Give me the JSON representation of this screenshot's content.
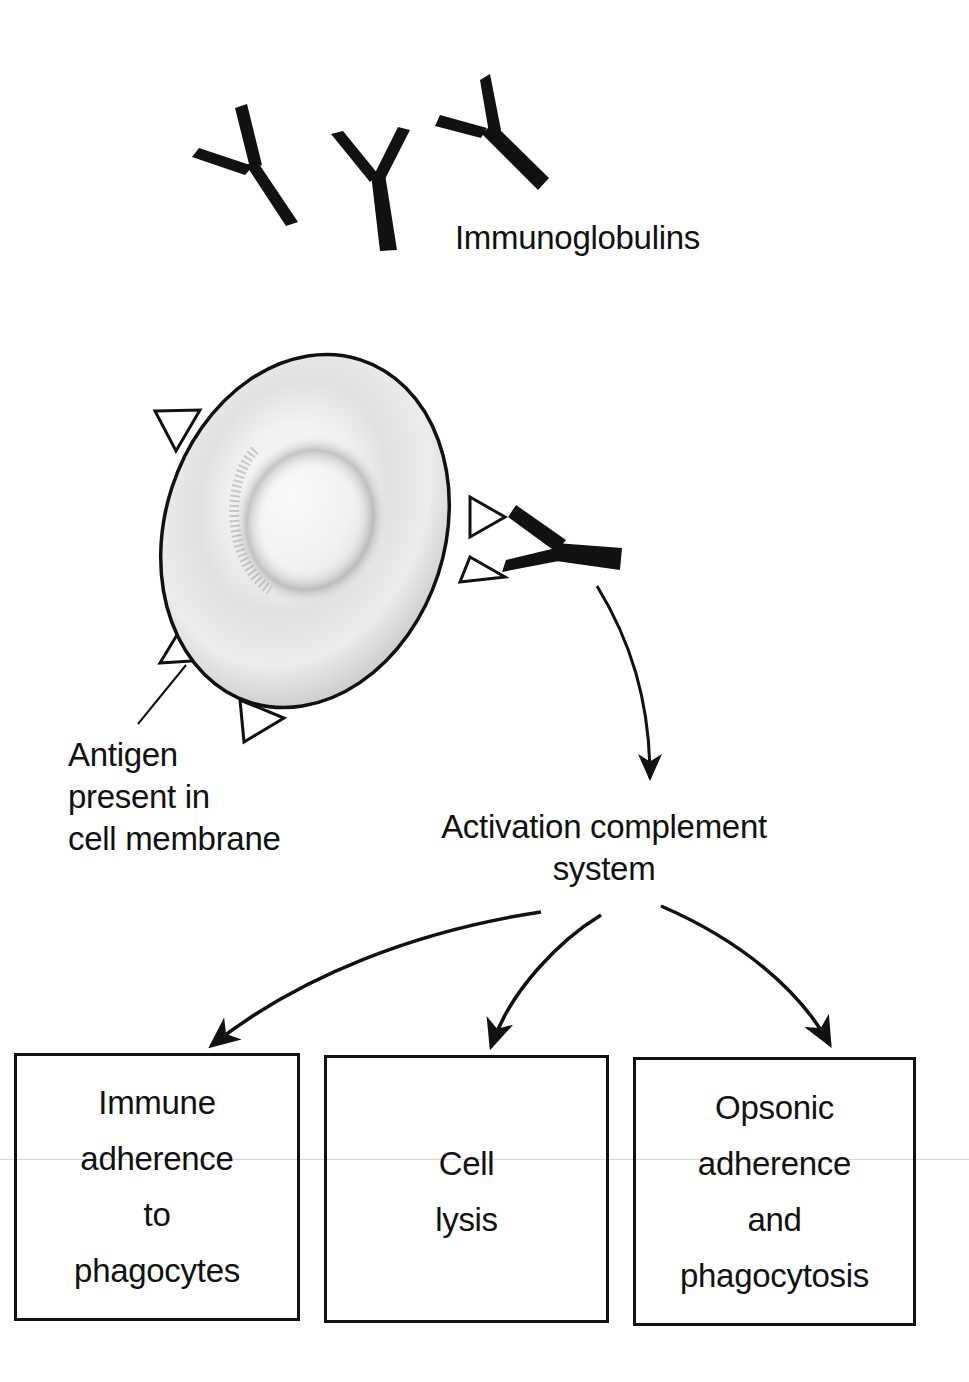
{
  "labels": {
    "immunoglobulins": "Immunoglobulins",
    "antigen": [
      "Antigen",
      "present in",
      "cell membrane"
    ],
    "activation": [
      "Activation complement",
      "system"
    ]
  },
  "boxes": [
    {
      "lines": [
        "Immune",
        "adherence",
        "to",
        "phagocytes"
      ]
    },
    {
      "lines": [
        "Cell",
        "lysis"
      ]
    },
    {
      "lines": [
        "Opsonic",
        "adherence",
        "and",
        "phagocytosis"
      ]
    }
  ],
  "colors": {
    "ink": "#111111",
    "background": "#ffffff"
  }
}
